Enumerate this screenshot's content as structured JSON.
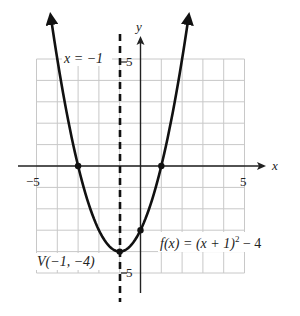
{
  "chart_data": {
    "type": "line",
    "title": "",
    "function": "f(x) = (x + 1)^2 - 4",
    "xlabel": "x",
    "ylabel": "y",
    "xlim": [
      -5,
      5
    ],
    "ylim": [
      -5,
      5
    ],
    "grid": true,
    "x_tick_labels": [
      "-5",
      "5"
    ],
    "y_tick_labels": [
      "5",
      "-5"
    ],
    "series": [
      {
        "name": "f(x) = (x + 1)^2 - 4",
        "x": [
          -4.3,
          -4,
          -3,
          -2,
          -1,
          0,
          1,
          2,
          2.3
        ],
        "y": [
          6.89,
          5,
          0,
          -3,
          -4,
          -3,
          0,
          5,
          6.89
        ]
      }
    ],
    "marked_points": [
      {
        "label": "x-intercept",
        "x": -3,
        "y": 0
      },
      {
        "label": "x-intercept",
        "x": 1,
        "y": 0
      },
      {
        "label": "y-intercept",
        "x": 0,
        "y": -3
      },
      {
        "label": "V(-1, -4)",
        "x": -1,
        "y": -4
      }
    ],
    "axis_of_symmetry": {
      "x": -1,
      "label": "x = -1",
      "style": "dashed"
    },
    "annotations": [
      "x = -1",
      "V(-1, -4)",
      "f(x) = (x + 1)^2 - 4"
    ]
  },
  "labels": {
    "x_axis": "x",
    "y_axis": "y",
    "x_min": "−5",
    "x_max": "5",
    "y_max": "5",
    "y_min": "5",
    "symmetry": "x = −1",
    "vertex": "V(−1, −4)",
    "function_main": "f(x) = (x + 1)",
    "function_exp": "2",
    "function_tail": " − 4"
  },
  "colors": {
    "grid": "#c8c8c8",
    "curve": "#111111",
    "axis": "#222222"
  }
}
